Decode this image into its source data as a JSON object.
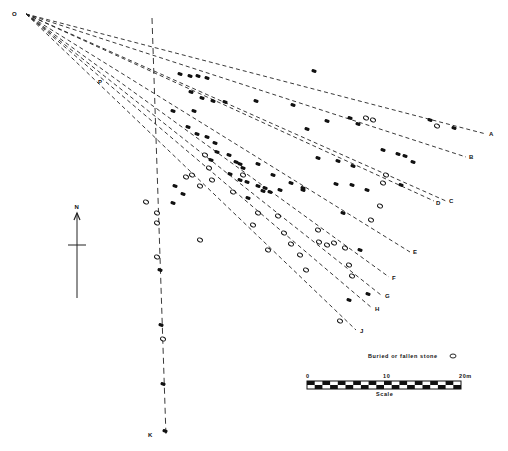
{
  "origin": {
    "label": "O",
    "x": 20,
    "y": 14
  },
  "rows": [
    {
      "label": "A",
      "end": [
        486,
        134
      ],
      "lx": 489,
      "ly": 136
    },
    {
      "label": "B",
      "end": [
        466,
        157
      ],
      "lx": 469,
      "ly": 159
    },
    {
      "label": "C",
      "end": [
        446,
        201
      ],
      "lx": 449,
      "ly": 203
    },
    {
      "label": "D",
      "end": [
        434,
        201
      ],
      "lx": 436,
      "ly": 205
    },
    {
      "label": "E",
      "end": [
        410,
        252
      ],
      "lx": 413,
      "ly": 254
    },
    {
      "label": "F",
      "end": [
        389,
        277
      ],
      "lx": 392,
      "ly": 280
    },
    {
      "label": "G",
      "end": [
        381,
        295
      ],
      "lx": 385,
      "ly": 298
    },
    {
      "label": "H",
      "end": [
        372,
        308
      ],
      "lx": 375,
      "ly": 311
    },
    {
      "label": "J",
      "end": [
        356,
        330
      ],
      "lx": 360,
      "ly": 333
    }
  ],
  "branch_label": {
    "label": "P",
    "x": 98,
    "y": 84
  },
  "vertical_row": {
    "label": "K",
    "top": [
      152,
      18
    ],
    "bottom": [
      166,
      436
    ],
    "lx": 156,
    "ly": 437
  },
  "stones_filled": [
    [
      314,
      71
    ],
    [
      180,
      74
    ],
    [
      190,
      76
    ],
    [
      198,
      76
    ],
    [
      207,
      78
    ],
    [
      191,
      92
    ],
    [
      202,
      98
    ],
    [
      213,
      101
    ],
    [
      225,
      102
    ],
    [
      194,
      111
    ],
    [
      173,
      111
    ],
    [
      256,
      101
    ],
    [
      293,
      105
    ],
    [
      327,
      121
    ],
    [
      307,
      129
    ],
    [
      350,
      118
    ],
    [
      358,
      124
    ],
    [
      188,
      127
    ],
    [
      430,
      120
    ],
    [
      454,
      128
    ],
    [
      383,
      150
    ],
    [
      398,
      154
    ],
    [
      405,
      156
    ],
    [
      413,
      162
    ],
    [
      318,
      158
    ],
    [
      338,
      161
    ],
    [
      353,
      166
    ],
    [
      336,
      184
    ],
    [
      352,
      185
    ],
    [
      367,
      190
    ],
    [
      401,
      185
    ],
    [
      197,
      134
    ],
    [
      207,
      137
    ],
    [
      215,
      143
    ],
    [
      240,
      180
    ],
    [
      247,
      182
    ],
    [
      258,
      186
    ],
    [
      263,
      191
    ],
    [
      270,
      192
    ],
    [
      280,
      190
    ],
    [
      291,
      183
    ],
    [
      303,
      190
    ],
    [
      217,
      152
    ],
    [
      229,
      155
    ],
    [
      236,
      162
    ],
    [
      243,
      168
    ],
    [
      230,
      174
    ],
    [
      343,
      213
    ],
    [
      240,
      164
    ],
    [
      258,
      164
    ],
    [
      273,
      175
    ],
    [
      303,
      188
    ],
    [
      360,
      250
    ],
    [
      160,
      270
    ],
    [
      161,
      325
    ],
    [
      349,
      300
    ],
    [
      368,
      294
    ],
    [
      175,
      186
    ],
    [
      183,
      194
    ],
    [
      173,
      203
    ],
    [
      163,
      384
    ],
    [
      165,
      431
    ],
    [
      211,
      160
    ],
    [
      248,
      198
    ],
    [
      265,
      188
    ]
  ],
  "stones_open": [
    [
      146,
      202
    ],
    [
      157,
      213
    ],
    [
      157,
      223
    ],
    [
      157,
      257
    ],
    [
      163,
      339
    ],
    [
      186,
      177
    ],
    [
      192,
      175
    ],
    [
      205,
      155
    ],
    [
      209,
      168
    ],
    [
      200,
      186
    ],
    [
      212,
      180
    ],
    [
      233,
      192
    ],
    [
      243,
      175
    ],
    [
      253,
      225
    ],
    [
      258,
      213
    ],
    [
      278,
      216
    ],
    [
      284,
      233
    ],
    [
      291,
      244
    ],
    [
      300,
      255
    ],
    [
      306,
      270
    ],
    [
      318,
      230
    ],
    [
      319,
      242
    ],
    [
      327,
      245
    ],
    [
      334,
      243
    ],
    [
      345,
      248
    ],
    [
      349,
      265
    ],
    [
      352,
      276
    ],
    [
      371,
      220
    ],
    [
      383,
      183
    ],
    [
      340,
      321
    ],
    [
      380,
      206
    ],
    [
      373,
      120
    ],
    [
      366,
      118
    ],
    [
      386,
      175
    ],
    [
      437,
      126
    ],
    [
      200,
      240
    ],
    [
      268,
      250
    ]
  ],
  "north_arrow": {
    "label": "N",
    "x": 77,
    "top": 213,
    "bottom": 298,
    "cross_y": 245
  },
  "legend": {
    "text": "Buried or fallen stone",
    "x": 368,
    "y": 358
  },
  "scale": {
    "title": "Scale",
    "ticks": [
      {
        "label": "0",
        "pos": 0
      },
      {
        "label": "10",
        "pos": 0.5
      },
      {
        "label": "20m",
        "pos": 1
      }
    ],
    "x": 307,
    "y": 381,
    "width": 154,
    "height": 8,
    "segments": 20
  }
}
